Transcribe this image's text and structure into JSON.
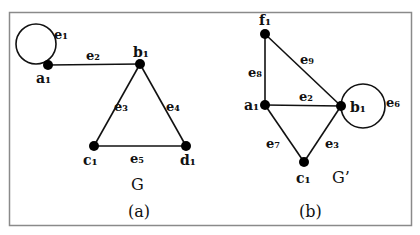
{
  "figure": {
    "border_color": "#888888",
    "edge_color": "#111111",
    "panels": [
      {
        "id": "a",
        "graph_name": "G",
        "caption": "(a)",
        "vertices": [
          {
            "name": "a1",
            "label": "a₁",
            "x": 48,
            "y": 65
          },
          {
            "name": "b1",
            "label": "b₁",
            "x": 140,
            "y": 64
          },
          {
            "name": "c1",
            "label": "c₁",
            "x": 94,
            "y": 146
          },
          {
            "name": "d1",
            "label": "d₁",
            "x": 186,
            "y": 146
          }
        ],
        "edges": [
          {
            "name": "e1",
            "label": "e₁",
            "from": "a1",
            "to": "a1",
            "type": "loop"
          },
          {
            "name": "e2",
            "label": "e₂",
            "from": "a1",
            "to": "b1"
          },
          {
            "name": "e3",
            "label": "e₃",
            "from": "b1",
            "to": "c1"
          },
          {
            "name": "e4",
            "label": "e₄",
            "from": "b1",
            "to": "d1"
          },
          {
            "name": "e5",
            "label": "e₅",
            "from": "c1",
            "to": "d1"
          }
        ]
      },
      {
        "id": "b",
        "graph_name": "G’",
        "caption": "(b)",
        "vertices": [
          {
            "name": "f1",
            "label": "f₁",
            "x": 265,
            "y": 34
          },
          {
            "name": "a1",
            "label": "a₁",
            "x": 265,
            "y": 105
          },
          {
            "name": "b1",
            "label": "b₁",
            "x": 341,
            "y": 106
          },
          {
            "name": "c1",
            "label": "c₁",
            "x": 304,
            "y": 162
          }
        ],
        "edges": [
          {
            "name": "e8",
            "label": "e₈",
            "from": "f1",
            "to": "a1"
          },
          {
            "name": "e9",
            "label": "e₉",
            "from": "f1",
            "to": "b1"
          },
          {
            "name": "e2",
            "label": "e₂",
            "from": "a1",
            "to": "b1"
          },
          {
            "name": "e6",
            "label": "e₆",
            "from": "b1",
            "to": "b1",
            "type": "loop"
          },
          {
            "name": "e7",
            "label": "e₇",
            "from": "a1",
            "to": "c1"
          },
          {
            "name": "e3",
            "label": "e₃",
            "from": "b1",
            "to": "c1"
          }
        ]
      }
    ]
  }
}
